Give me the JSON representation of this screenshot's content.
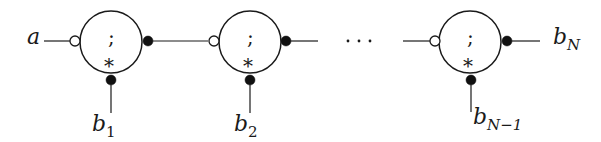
{
  "diagram": {
    "input_label": "a",
    "ellipsis": "···",
    "output_label": {
      "base": "b",
      "sub": "N"
    },
    "nodes": [
      {
        "center_symbol": ";",
        "bottom_symbol": "*",
        "bottom_label": {
          "base": "b",
          "sub": "1"
        }
      },
      {
        "center_symbol": ";",
        "bottom_symbol": "*",
        "bottom_label": {
          "base": "b",
          "sub": "2"
        }
      },
      {
        "center_symbol": ";",
        "bottom_symbol": "*",
        "bottom_label": {
          "base": "b",
          "sub": "N−1"
        }
      }
    ],
    "icons": {
      "input_port": "open-circle",
      "output_port": "filled-circle",
      "bottom_port": "filled-circle"
    },
    "colors": {
      "stroke": "#1a1a1a",
      "fill": "#ffffff",
      "dot": "#111111"
    }
  }
}
